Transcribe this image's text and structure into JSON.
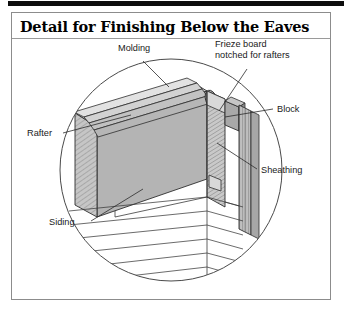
{
  "document": {
    "title": "Detail for Finishing Below the Eaves"
  },
  "figure": {
    "type": "architectural-cutaway-detail",
    "view": "isometric circular vignette",
    "labels": [
      {
        "id": "molding",
        "text": "Molding",
        "text2": ""
      },
      {
        "id": "frieze",
        "text": "Frieze board",
        "text2": "notched for rafters"
      },
      {
        "id": "block",
        "text": "Block",
        "text2": ""
      },
      {
        "id": "sheathing",
        "text": "Sheathing",
        "text2": ""
      },
      {
        "id": "rafter",
        "text": "Rafter",
        "text2": ""
      },
      {
        "id": "siding",
        "text": "Siding",
        "text2": ""
      }
    ]
  },
  "colors": {
    "ink": "#1a1a1a",
    "line": "#3a3a3a",
    "frame": "#8c8c8c",
    "rule": "#0d0d0d",
    "rafter_face": "#b4b4b4",
    "rafter_top": "#cfcfcf",
    "rafter_end": "#c6c6c6",
    "frieze_face": "#c9c9c9",
    "sheathing_face": "#bfbfbf",
    "block_face": "#a8a8a8",
    "molding_face": "#d2d2d2",
    "paper": "#ffffff"
  }
}
